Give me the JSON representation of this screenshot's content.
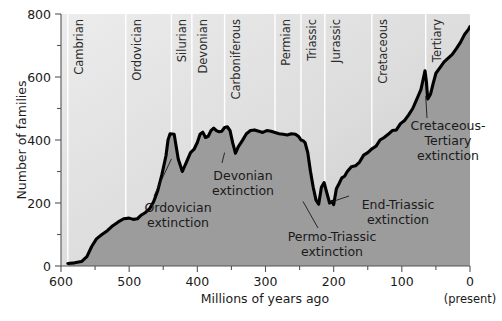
{
  "chart_data": {
    "type": "area",
    "title": "",
    "xlabel": "Millions of years ago",
    "ylabel": "Number of families",
    "xlim": [
      600,
      0
    ],
    "ylim": [
      0,
      800
    ],
    "x_reversed": true,
    "grid": true,
    "legend": "none",
    "x_ticks_major": [
      600,
      500,
      400,
      300,
      200,
      100,
      0
    ],
    "x_ticks_minor": [
      550,
      450,
      350,
      250,
      150,
      50
    ],
    "y_ticks_major": [
      0,
      200,
      400,
      600,
      800
    ],
    "y_ticks_minor": [
      100,
      300,
      500,
      700
    ],
    "x_axis_end_note": "(present)",
    "series": [
      {
        "name": "Number of families",
        "x": [
          590,
          580,
          570,
          562,
          555,
          548,
          540,
          532,
          524,
          516,
          508,
          500,
          494,
          488,
          482,
          476,
          470,
          464,
          458,
          452,
          446,
          443,
          440,
          434,
          428,
          422,
          416,
          410,
          405,
          400,
          396,
          392,
          388,
          384,
          380,
          376,
          372,
          368,
          364,
          360,
          356,
          352,
          348,
          344,
          340,
          334,
          328,
          322,
          316,
          310,
          304,
          298,
          292,
          286,
          280,
          274,
          268,
          262,
          256,
          251,
          248,
          245,
          242,
          238,
          234,
          230,
          226,
          222,
          218,
          214,
          210,
          206,
          202,
          200,
          196,
          192,
          188,
          184,
          180,
          174,
          168,
          162,
          156,
          150,
          144,
          138,
          132,
          126,
          120,
          114,
          108,
          102,
          96,
          90,
          84,
          78,
          72,
          68,
          66,
          64,
          62,
          58,
          54,
          50,
          44,
          38,
          32,
          26,
          20,
          14,
          8,
          2,
          0
        ],
        "y": [
          8,
          10,
          14,
          30,
          62,
          86,
          100,
          112,
          128,
          140,
          150,
          152,
          148,
          150,
          162,
          170,
          182,
          205,
          240,
          290,
          350,
          400,
          420,
          418,
          340,
          300,
          330,
          360,
          370,
          392,
          418,
          425,
          408,
          412,
          430,
          438,
          430,
          426,
          428,
          440,
          442,
          430,
          390,
          358,
          378,
          398,
          420,
          430,
          432,
          428,
          424,
          430,
          428,
          424,
          420,
          418,
          416,
          420,
          418,
          410,
          400,
          398,
          392,
          360,
          300,
          250,
          210,
          196,
          250,
          265,
          232,
          200,
          205,
          195,
          245,
          262,
          280,
          285,
          300,
          315,
          318,
          330,
          352,
          360,
          372,
          380,
          400,
          408,
          418,
          430,
          432,
          452,
          462,
          480,
          500,
          530,
          560,
          600,
          620,
          585,
          530,
          545,
          580,
          612,
          630,
          648,
          660,
          672,
          690,
          710,
          735,
          752,
          760
        ],
        "units": "families"
      }
    ],
    "periods": [
      {
        "name": "Cambrian",
        "boundary_ma": 590
      },
      {
        "name": "Ordovician",
        "boundary_ma": 505
      },
      {
        "name": "Silurian",
        "boundary_ma": 438
      },
      {
        "name": "Devonian",
        "boundary_ma": 408
      },
      {
        "name": "Carboniferous",
        "boundary_ma": 360
      },
      {
        "name": "Permian",
        "boundary_ma": 286
      },
      {
        "name": "Triassic",
        "boundary_ma": 248
      },
      {
        "name": "Jurassic",
        "boundary_ma": 213
      },
      {
        "name": "Cretaceous",
        "boundary_ma": 144
      },
      {
        "name": "Tertiary",
        "boundary_ma": 65
      }
    ],
    "annotations": [
      {
        "id": "ordovician",
        "lines": [
          "Ordovician",
          "extinction"
        ],
        "target_ma": 438,
        "target_value": 340
      },
      {
        "id": "devonian",
        "lines": [
          "Devonian",
          "extinction"
        ],
        "target_ma": 360,
        "target_value": 360
      },
      {
        "id": "permo-triassic",
        "lines": [
          "Permo-Triassic",
          "extinction"
        ],
        "target_ma": 245,
        "target_value": 205
      },
      {
        "id": "end-triassic",
        "lines": [
          "End-Triassic",
          "extinction"
        ],
        "target_ma": 208,
        "target_value": 200
      },
      {
        "id": "cretaceous-tertiary",
        "lines": [
          "Cretaceous-",
          "Tertiary",
          "extinction"
        ],
        "target_ma": 65,
        "target_value": 540
      }
    ],
    "colors": {
      "background": "#ffffff",
      "plot_top_left": "#ececec",
      "plot_bottom_right": "#c9c9c9",
      "area_fill": "#9c9c9c",
      "curve": "#000000",
      "gridline": "#ffffff",
      "axis": "#555555",
      "text": "#1a1a1a"
    }
  }
}
